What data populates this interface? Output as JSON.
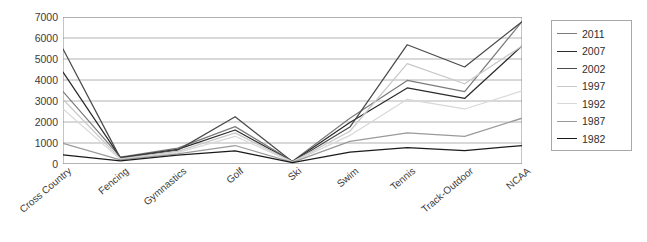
{
  "chart_data": {
    "type": "line",
    "title": "",
    "xlabel": "",
    "ylabel": "",
    "ylim": [
      0,
      7000
    ],
    "yticks": [
      7000,
      6000,
      5000,
      4000,
      3000,
      2000,
      1000,
      0
    ],
    "ytick_labels": [
      "7000",
      "6000",
      "5000",
      "4000",
      "3000",
      "2000",
      "1000",
      "0"
    ],
    "grid": true,
    "grid_axis": "y",
    "legend_position": "right",
    "categories": [
      "Cross Country",
      "Fencing",
      "Gymnastics",
      "Golf",
      "Ski",
      "Swim",
      "Tennis",
      "Track-Outdoor",
      "NCAA"
    ],
    "series": [
      {
        "name": "2011",
        "color": "#7b7b7b",
        "values": [
          3450,
          330,
          760,
          1780,
          130,
          2180,
          3980,
          3450,
          6780
        ]
      },
      {
        "name": "2007",
        "color": "#2b2b2b",
        "values": [
          4380,
          300,
          700,
          1620,
          120,
          1980,
          3620,
          3120,
          5620
        ]
      },
      {
        "name": "2002",
        "color": "#4a4a4a",
        "values": [
          5480,
          280,
          660,
          2250,
          110,
          1760,
          5680,
          4620,
          6780
        ]
      },
      {
        "name": "1997",
        "color": "#c8c8c8",
        "values": [
          3080,
          250,
          600,
          1480,
          100,
          1560,
          4780,
          3820,
          5620
        ]
      },
      {
        "name": "1992",
        "color": "#d8d8d8",
        "values": [
          2620,
          220,
          540,
          1320,
          90,
          1360,
          3080,
          2620,
          3480
        ]
      },
      {
        "name": "1987",
        "color": "#9a9a9a",
        "values": [
          980,
          200,
          480,
          880,
          80,
          1080,
          1480,
          1320,
          2180
        ]
      },
      {
        "name": "1982",
        "color": "#1a1a1a",
        "values": [
          430,
          150,
          420,
          620,
          70,
          560,
          780,
          640,
          880
        ]
      }
    ]
  },
  "legend": {
    "entries": [
      {
        "label": "2011"
      },
      {
        "label": "2007"
      },
      {
        "label": "2002"
      },
      {
        "label": "1997"
      },
      {
        "label": "1992"
      },
      {
        "label": "1987"
      },
      {
        "label": "1982"
      }
    ]
  },
  "axes": {
    "frame_color": "#8a8a8a",
    "grid_color": "#9e9e9e"
  }
}
